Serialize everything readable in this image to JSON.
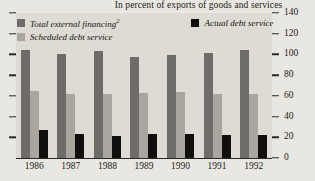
{
  "chart_data": {
    "type": "bar",
    "title": "In percent of exports of goods and services",
    "xlabel": "",
    "ylabel": "",
    "ylim": [
      0,
      140
    ],
    "yticks": [
      0,
      20,
      40,
      60,
      80,
      100,
      120,
      140
    ],
    "grid": false,
    "legend_position": "top-left",
    "categories": [
      "1986",
      "1987",
      "1988",
      "1989",
      "1990",
      "1991",
      "1992"
    ],
    "series": [
      {
        "name": "Total external financing",
        "footnote": "2",
        "color": "#6e6c68",
        "values": [
          104,
          100,
          103,
          98,
          99,
          101,
          104
        ]
      },
      {
        "name": "Scheduled debt service",
        "color": "#a9a69f",
        "values": [
          65,
          62,
          62,
          63,
          64,
          62,
          62
        ]
      },
      {
        "name": "Actual debt service",
        "color": "#100f0d",
        "values": [
          27,
          23,
          21,
          23,
          23,
          22,
          22
        ]
      }
    ]
  },
  "axis": {
    "tick_labels": [
      "140",
      "120",
      "100",
      "80",
      "60",
      "40",
      "20",
      "0"
    ]
  },
  "legend": {
    "total_label": "Total external financing",
    "total_sup": "2",
    "sched_label": "Scheduled debt service",
    "actual_label": "Actual debt service"
  }
}
